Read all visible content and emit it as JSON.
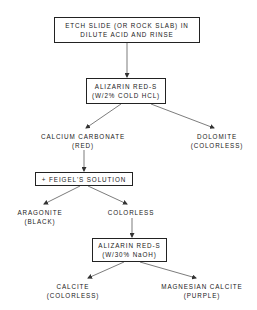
{
  "diagram": {
    "type": "flowchart",
    "nodes": {
      "etch": {
        "line1": "ETCH SLIDE (OR ROCK SLAB) IN",
        "line2": "DILUTE ACID AND RINSE"
      },
      "alizarin_hcl": {
        "line1": "ALIZARIN RED-S",
        "line2": "(W/2% COLD HCL)"
      },
      "calcium_carbonate": {
        "line1": "CALCIUM CARBONATE",
        "line2": "(RED)"
      },
      "dolomite": {
        "line1": "DOLOMITE",
        "line2": "(COLORLESS)"
      },
      "feigel": {
        "line1": "+ FEIGEL'S SOLUTION"
      },
      "aragonite": {
        "line1": "ARAGONITE",
        "line2": "(BLACK)"
      },
      "colorless": {
        "line1": "COLORLESS"
      },
      "alizarin_naoh": {
        "line1": "ALIZARIN RED-S",
        "line2": "(W/30% NaOH)"
      },
      "calcite": {
        "line1": "CALCITE",
        "line2": "(COLORLESS)"
      },
      "magnesian_calcite": {
        "line1": "MAGNESIAN CALCITE",
        "line2": "(PURPLE)"
      }
    },
    "edges": [
      [
        "etch",
        "alizarin_hcl"
      ],
      [
        "alizarin_hcl",
        "calcium_carbonate"
      ],
      [
        "alizarin_hcl",
        "dolomite"
      ],
      [
        "calcium_carbonate",
        "feigel"
      ],
      [
        "feigel",
        "aragonite"
      ],
      [
        "feigel",
        "colorless"
      ],
      [
        "colorless",
        "alizarin_naoh"
      ],
      [
        "alizarin_naoh",
        "calcite"
      ],
      [
        "alizarin_naoh",
        "magnesian_calcite"
      ]
    ]
  }
}
